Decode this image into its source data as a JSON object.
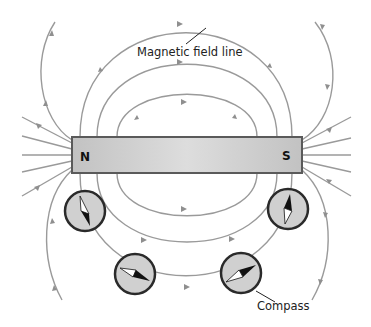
{
  "diagram": {
    "labels": {
      "field_line": "Magnetic field line",
      "compass": "Compass"
    },
    "magnet": {
      "north_label": "N",
      "south_label": "S",
      "fill_color": "#c8c8c8",
      "border_color": "#5a5a5a"
    },
    "field_line_color": "#9a9a9a",
    "compass": {
      "count": 4,
      "fill_color": "#d0d0d0",
      "ring_color": "#2a2a2a",
      "items": [
        {
          "position": "left-under-N",
          "north_end": "up"
        },
        {
          "position": "right-under-S",
          "north_end": "up"
        },
        {
          "position": "bottom-left",
          "north_end": "right-down"
        },
        {
          "position": "bottom-right",
          "north_end": "right-up"
        }
      ]
    }
  }
}
